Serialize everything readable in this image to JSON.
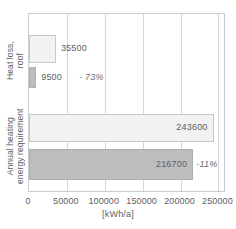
{
  "chart_data": {
    "type": "bar",
    "orientation": "horizontal",
    "title": "",
    "xlabel": "[kWh/a]",
    "ylabel": "",
    "xlim": [
      0,
      260000
    ],
    "xticks": [
      0,
      50000,
      100000,
      150000,
      200000,
      250000
    ],
    "xtick_labels": [
      "0",
      "50000",
      "100000",
      "150000",
      "200000",
      "250000"
    ],
    "grid": true,
    "legend": "none",
    "categories": [
      "Heat loss, roof",
      "Annual heating energy requirement"
    ],
    "groups": [
      {
        "category": "Heat loss, roof",
        "label_lines": [
          "Heat loss,",
          "roof"
        ],
        "bars": [
          {
            "value": 35500,
            "value_label": "35500",
            "style": "light",
            "delta": ""
          },
          {
            "value": 9500,
            "value_label": "9500",
            "style": "dark",
            "delta": "- 73%"
          }
        ]
      },
      {
        "category": "Annual heating energy requirement",
        "label_lines": [
          "Annual heating",
          "energy requirement"
        ],
        "bars": [
          {
            "value": 243600,
            "value_label": "243600",
            "style": "light",
            "delta": ""
          },
          {
            "value": 216700,
            "value_label": "216700",
            "style": "dark",
            "delta": "-11%"
          }
        ]
      }
    ],
    "series": [
      {
        "name": "existing",
        "values": [
          35500,
          243600
        ],
        "style": "light",
        "color": "#f2f2f2"
      },
      {
        "name": "refurbished",
        "values": [
          9500,
          216700
        ],
        "style": "dark",
        "color": "#bdbdbd"
      }
    ],
    "annotations": [
      "- 73%",
      "-11%"
    ],
    "colors": {
      "light_bar": "#f2f2f2",
      "dark_bar": "#bdbdbd",
      "bar_outline": "#b9bbbd",
      "gridline": "#d4d6d8",
      "frame": "#c9cbcd",
      "text": "#5d6164",
      "background": "#ffffff"
    }
  }
}
